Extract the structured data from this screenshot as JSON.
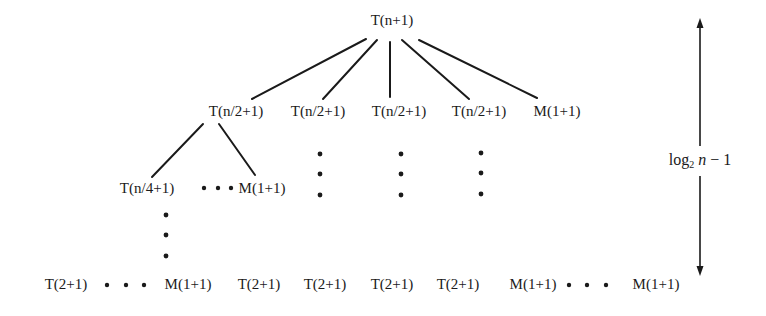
{
  "diagram": {
    "type": "recursion-tree",
    "root": {
      "label": "T(n+1)",
      "x": 392,
      "y": 20
    },
    "level1": [
      {
        "label": "T(n/2+1)",
        "x": 236,
        "y": 111
      },
      {
        "label": "T(n/2+1)",
        "x": 318,
        "y": 111
      },
      {
        "label": "T(n/2+1)",
        "x": 399,
        "y": 111
      },
      {
        "label": "T(n/2+1)",
        "x": 479,
        "y": 111
      },
      {
        "label": "M(1+1)",
        "x": 557,
        "y": 111
      }
    ],
    "level2": [
      {
        "label": "T(n/4+1)",
        "x": 147,
        "y": 188
      },
      {
        "label": "M(1+1)",
        "x": 262,
        "y": 188
      }
    ],
    "leaves": [
      {
        "label": "T(2+1)",
        "x": 66,
        "y": 284
      },
      {
        "label": "M(1+1)",
        "x": 188,
        "y": 284
      },
      {
        "label": "T(2+1)",
        "x": 259,
        "y": 284
      },
      {
        "label": "T(2+1)",
        "x": 325,
        "y": 284
      },
      {
        "label": "T(2+1)",
        "x": 392,
        "y": 284
      },
      {
        "label": "T(2+1)",
        "x": 458,
        "y": 284
      },
      {
        "label": "M(1+1)",
        "x": 533,
        "y": 284
      },
      {
        "label": "M(1+1)",
        "x": 656,
        "y": 284
      }
    ],
    "edges": [
      {
        "from": "root",
        "to": "level1.0",
        "x1": 366,
        "y1": 39,
        "x2": 252,
        "y2": 99
      },
      {
        "from": "root",
        "to": "level1.1",
        "x1": 377,
        "y1": 40,
        "x2": 323,
        "y2": 99
      },
      {
        "from": "root",
        "to": "level1.2",
        "x1": 390,
        "y1": 42,
        "x2": 390,
        "y2": 97
      },
      {
        "from": "root",
        "to": "level1.3",
        "x1": 402,
        "y1": 40,
        "x2": 469,
        "y2": 99
      },
      {
        "from": "root",
        "to": "level1.4",
        "x1": 419,
        "y1": 40,
        "x2": 537,
        "y2": 98
      },
      {
        "from": "level1.0",
        "to": "level2.0",
        "x1": 203,
        "y1": 124,
        "x2": 152,
        "y2": 177
      },
      {
        "from": "level1.0",
        "to": "level2.1",
        "x1": 219,
        "y1": 124,
        "x2": 255,
        "y2": 175
      }
    ],
    "horizontal_ellipses": [
      {
        "y": 188,
        "xs": [
          204,
          218,
          231
        ]
      },
      {
        "y": 285,
        "xs": [
          107,
          126,
          144
        ]
      },
      {
        "y": 285,
        "xs": [
          569,
          587,
          606
        ]
      }
    ],
    "vertical_ellipses": [
      {
        "x": 320,
        "ys": [
          154,
          174,
          195
        ]
      },
      {
        "x": 401,
        "ys": [
          154,
          174,
          195
        ]
      },
      {
        "x": 481,
        "ys": [
          153,
          173,
          194
        ]
      },
      {
        "x": 166,
        "ys": [
          215,
          235,
          256
        ]
      }
    ],
    "height_arrow": {
      "label_base": "log",
      "label_sub": "2",
      "label_var": "n",
      "label_rest": " − 1",
      "x": 700,
      "y_top": 18,
      "y_bottom": 276,
      "label_y": 161
    },
    "colors": {
      "ink": "#1a1a1a",
      "background": "#ffffff"
    }
  }
}
